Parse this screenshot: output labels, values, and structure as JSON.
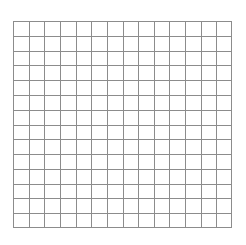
{
  "canvas": {
    "width": 246,
    "height": 245,
    "background_color": "#ffffff",
    "name": "grid-canvas"
  },
  "grid": {
    "label": "grid",
    "origin_x": 13,
    "origin_y": 21,
    "width": 219,
    "height": 207,
    "columns": 14,
    "rows": 14,
    "cell_width": 15.64,
    "cell_height": 14.79,
    "line_color": "#8c8c8c",
    "line_width": 1,
    "border_color": "#8c8c8c",
    "border_width": 1,
    "fill_color": "#ffffff"
  },
  "chart_data": {
    "type": "table",
    "title": "",
    "subtitle": "",
    "xlabel": "",
    "ylabel": "",
    "grid": true,
    "legend": "none",
    "columns": 14,
    "rows": 14,
    "x_ticks": [
      0,
      1,
      2,
      3,
      4,
      5,
      6,
      7,
      8,
      9,
      10,
      11,
      12,
      13,
      14
    ],
    "y_ticks": [
      0,
      1,
      2,
      3,
      4,
      5,
      6,
      7,
      8,
      9,
      10,
      11,
      12,
      13,
      14
    ],
    "xlim": [
      0,
      14
    ],
    "ylim": [
      0,
      14
    ],
    "tick_labels_visible": false,
    "series": [],
    "values": [],
    "annotations": []
  }
}
